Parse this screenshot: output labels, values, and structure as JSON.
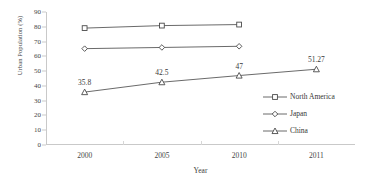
{
  "chart_data": {
    "type": "line",
    "title": "",
    "xlabel": "Year",
    "ylabel": "Urban Population (%)",
    "categories": [
      "2000",
      "2005",
      "2010",
      "2011"
    ],
    "ylim": [
      0,
      90
    ],
    "yticks": [
      "0",
      "10",
      "20",
      "30",
      "40",
      "50",
      "60",
      "70",
      "80",
      "90"
    ],
    "grid": false,
    "legend_position": "center-right-inside",
    "series": [
      {
        "name": "North America",
        "marker": "square-open",
        "color": "#595959",
        "x": [
          "2000",
          "2005",
          "2010"
        ],
        "values": [
          79.1,
          80.8,
          81.5
        ],
        "labels": []
      },
      {
        "name": "Japan",
        "marker": "diamond-open",
        "color": "#595959",
        "x": [
          "2000",
          "2005",
          "2010"
        ],
        "values": [
          65.2,
          66.0,
          66.8
        ],
        "labels": []
      },
      {
        "name": "China",
        "marker": "triangle-open",
        "color": "#595959",
        "x": [
          "2000",
          "2005",
          "2010",
          "2011"
        ],
        "values": [
          35.8,
          42.5,
          47,
          51.27
        ],
        "labels": [
          "35.8",
          "42.5",
          "47",
          "51.27"
        ]
      }
    ]
  }
}
